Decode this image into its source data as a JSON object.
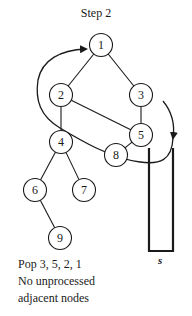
{
  "title": "Step 2",
  "graph": {
    "nodes": [
      {
        "id": "1",
        "label": "1",
        "x": 101,
        "y": 45
      },
      {
        "id": "2",
        "label": "2",
        "x": 61,
        "y": 95
      },
      {
        "id": "3",
        "label": "3",
        "x": 141,
        "y": 95
      },
      {
        "id": "4",
        "label": "4",
        "x": 61,
        "y": 142
      },
      {
        "id": "5",
        "label": "5",
        "x": 141,
        "y": 135
      },
      {
        "id": "6",
        "label": "6",
        "x": 35,
        "y": 190
      },
      {
        "id": "7",
        "label": "7",
        "x": 84,
        "y": 190
      },
      {
        "id": "8",
        "label": "8",
        "x": 116,
        "y": 155
      },
      {
        "id": "9",
        "label": "9",
        "x": 60,
        "y": 238
      }
    ],
    "edges": [
      [
        "1",
        "2"
      ],
      [
        "1",
        "3"
      ],
      [
        "2",
        "4"
      ],
      [
        "2",
        "5"
      ],
      [
        "3",
        "5"
      ],
      [
        "4",
        "6"
      ],
      [
        "4",
        "7"
      ],
      [
        "5",
        "8"
      ],
      [
        "6",
        "9"
      ]
    ]
  },
  "stack": {
    "label": "s",
    "contents": []
  },
  "caption": {
    "line1": "Pop 3, 5, 2, 1",
    "line2": "No unprocessed",
    "line3": "adjacent nodes"
  }
}
